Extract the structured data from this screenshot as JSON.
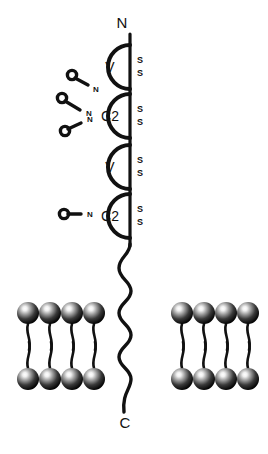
{
  "figure": {
    "background_color": "#ffffff",
    "stroke_color": "#111111",
    "width": 268,
    "height": 454
  },
  "termini": {
    "n_terminus": {
      "label": "N",
      "x": 122,
      "y": 24
    },
    "c_terminus": {
      "label": "C",
      "x": 125,
      "y": 424
    }
  },
  "backbone": {
    "name": "polypeptide-backbone",
    "top_y": 34,
    "bottom_y": 412,
    "x": 130,
    "stroke_width": 3.2
  },
  "domains": [
    {
      "id": "domain-1",
      "label": "V",
      "type": "V-set immunoglobulin domain",
      "cx": 113,
      "cy": 67,
      "r": 22,
      "disulfide": {
        "labels": [
          "S",
          "S"
        ],
        "x": 140,
        "y_top": 60,
        "y_bottom": 73
      }
    },
    {
      "id": "domain-2",
      "label": "C2",
      "type": "C2-set immunoglobulin domain",
      "cx": 113,
      "cy": 116,
      "r": 22,
      "disulfide": {
        "labels": [
          "S",
          "S"
        ],
        "x": 140,
        "y_top": 109,
        "y_bottom": 122
      }
    },
    {
      "id": "domain-3",
      "label": "V",
      "type": "V-set immunoglobulin domain",
      "cx": 113,
      "cy": 167,
      "r": 22,
      "disulfide": {
        "labels": [
          "S",
          "S"
        ],
        "x": 140,
        "y_top": 160,
        "y_bottom": 173
      }
    },
    {
      "id": "domain-4",
      "label": "C2",
      "type": "C2-set immunoglobulin domain",
      "cx": 113,
      "cy": 216,
      "r": 22,
      "disulfide": {
        "labels": [
          "S",
          "S"
        ],
        "x": 140,
        "y_top": 209,
        "y_bottom": 222
      }
    }
  ],
  "glycans": [
    {
      "id": "glycan-1",
      "label": "N",
      "type": "N-linked-glycan",
      "ring": {
        "cx": 72,
        "cy": 75,
        "r": 4.6
      },
      "stem": {
        "x1": 75,
        "y1": 78,
        "x2": 87,
        "y2": 85
      },
      "label_pos": {
        "x": 95,
        "y": 89
      }
    },
    {
      "id": "glycan-2",
      "label": "N",
      "type": "N-linked-glycan",
      "ring": {
        "cx": 62,
        "cy": 98,
        "r": 4.6
      },
      "stem": {
        "x1": 65,
        "y1": 101,
        "x2": 79,
        "y2": 109
      },
      "label_pos": {
        "x": 88,
        "y": 113
      }
    },
    {
      "id": "glycan-3",
      "label": "N",
      "type": "N-linked-glycan",
      "ring": {
        "cx": 65,
        "cy": 131,
        "r": 4.6
      },
      "stem": {
        "x1": 68,
        "y1": 129,
        "x2": 80,
        "y2": 122
      },
      "label_pos": {
        "x": 89,
        "y": 119
      }
    },
    {
      "id": "glycan-4",
      "label": "N",
      "type": "N-linked-glycan",
      "ring": {
        "cx": 64,
        "cy": 214,
        "r": 4.6
      },
      "stem": {
        "x1": 68,
        "y1": 214,
        "x2": 80,
        "y2": 214
      },
      "label_pos": {
        "x": 89,
        "y": 215
      }
    }
  ],
  "tail": {
    "name": "transmembrane-cytoplasmic-tail",
    "description": "wavy serpentine segment from stalk to C terminus",
    "path": "M130,246 C130,256 119,258 119,268 C119,278 131,280 131,290 C131,300 119,302 119,312 C119,322 131,324 131,334 C131,344 119,346 119,356 C119,366 131,368 131,378 C131,388 122,392 124,412"
  },
  "membranes": [
    {
      "id": "membrane-left",
      "name": "lipid-bilayer-left",
      "x": 14,
      "y": 292,
      "leaflets": [
        {
          "id": "outer-leaflet",
          "orientation": "heads-up",
          "head_y": 313,
          "lipids": [
            {
              "head_cx": 28,
              "head_r": 11,
              "tail": "M28,324 C25,334 32,338 29,350"
            },
            {
              "head_cx": 50,
              "head_r": 11,
              "tail": "M50,324 C47,334 54,338 51,350"
            },
            {
              "head_cx": 72,
              "head_r": 11,
              "tail": "M72,324 C69,334 76,338 73,350"
            },
            {
              "head_cx": 94,
              "head_r": 11,
              "tail": "M94,324 C91,334 98,338 95,350"
            }
          ]
        },
        {
          "id": "inner-leaflet",
          "orientation": "heads-down",
          "head_y": 379,
          "lipids": [
            {
              "head_cx": 28,
              "head_r": 11,
              "tail": "M28,368 C25,358 32,354 29,342"
            },
            {
              "head_cx": 50,
              "head_r": 11,
              "tail": "M50,368 C47,358 54,354 51,342"
            },
            {
              "head_cx": 72,
              "head_r": 11,
              "tail": "M72,368 C69,358 76,354 73,342"
            },
            {
              "head_cx": 94,
              "head_r": 11,
              "tail": "M94,368 C91,358 98,354 95,342"
            }
          ]
        }
      ]
    },
    {
      "id": "membrane-right",
      "name": "lipid-bilayer-right",
      "x": 164,
      "y": 292,
      "leaflets": [
        {
          "id": "outer-leaflet",
          "orientation": "heads-up",
          "head_y": 313,
          "lipids": [
            {
              "head_cx": 182,
              "head_r": 11,
              "tail": "M182,324 C179,334 186,338 183,350"
            },
            {
              "head_cx": 204,
              "head_r": 11,
              "tail": "M204,324 C201,334 208,338 205,350"
            },
            {
              "head_cx": 226,
              "head_r": 11,
              "tail": "M226,324 C223,334 230,338 227,350"
            },
            {
              "head_cx": 248,
              "head_r": 11,
              "tail": "M248,324 C245,334 252,338 249,350"
            }
          ]
        },
        {
          "id": "inner-leaflet",
          "orientation": "heads-down",
          "head_y": 379,
          "lipids": [
            {
              "head_cx": 182,
              "head_r": 11,
              "tail": "M182,368 C179,358 186,354 183,342"
            },
            {
              "head_cx": 204,
              "head_r": 11,
              "tail": "M204,368 C201,358 208,354 205,342"
            },
            {
              "head_cx": 226,
              "head_r": 11,
              "tail": "M226,368 C223,358 230,354 227,342"
            },
            {
              "head_cx": 248,
              "head_r": 11,
              "tail": "M248,368 C245,358 252,354 249,342"
            }
          ]
        }
      ]
    }
  ],
  "colors": {
    "ink": "#111111",
    "background": "#ffffff",
    "lipid_head_highlight": "#f2f2f2",
    "lipid_head_mid": "#6e6e6e",
    "lipid_head_edge": "#050505"
  }
}
